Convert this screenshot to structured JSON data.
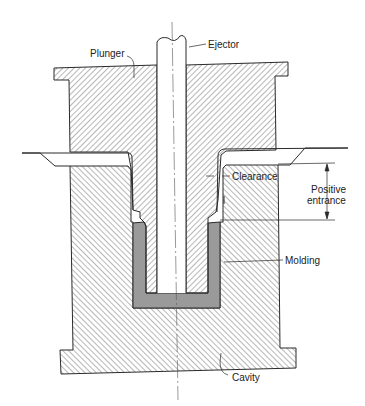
{
  "diagram": {
    "type": "cross-section",
    "colors": {
      "line": "#2a2a2a",
      "hatch": "#4a4a4a",
      "molding": "#9a9a9a",
      "background": "#ffffff"
    },
    "labels": {
      "ejector": "Ejector",
      "plunger": "Plunger",
      "clearance": "Clearance",
      "positive_entrance_line1": "Positive",
      "positive_entrance_line2": "entrance",
      "molding": "Molding",
      "cavity": "Cavity"
    }
  }
}
